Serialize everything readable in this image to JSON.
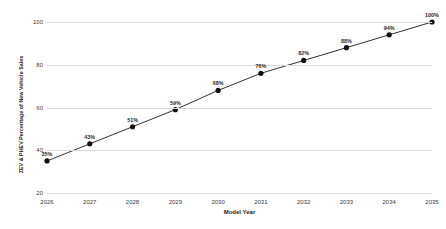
{
  "chart_data": {
    "type": "line",
    "title": "",
    "xlabel": "Model Year",
    "ylabel": "ZEV & PHEV Percentage of New Vehicle Sales",
    "categories": [
      "2026",
      "2027",
      "2028",
      "2029",
      "2030",
      "2031",
      "2032",
      "2033",
      "2034",
      "2035"
    ],
    "values": [
      35,
      43,
      51,
      59,
      68,
      76,
      82,
      88,
      94,
      100
    ],
    "point_labels": [
      "35%",
      "43%",
      "51%",
      "59%",
      "68%",
      "76%",
      "82%",
      "88%",
      "94%",
      "100%"
    ],
    "ylim": [
      20,
      100
    ],
    "yticks": [
      20,
      40,
      60,
      80,
      100
    ],
    "ytick_labels": [
      "20",
      "40",
      "60",
      "80",
      "100"
    ],
    "grid": "horizontal",
    "legend": "none",
    "line_color": "#1a1a1a",
    "marker_color": "#111111",
    "grid_color": "#d8d8d8",
    "background": "#ffffff"
  }
}
